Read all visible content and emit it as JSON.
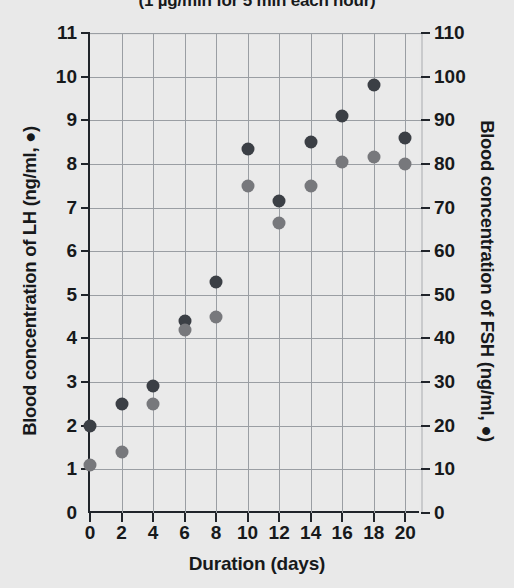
{
  "chart_data": {
    "type": "scatter",
    "title": "(1 µg/min for 5 min each hour)",
    "xlabel": "Duration (days)",
    "ylabel_left": "Blood concentration of LH (ng/ml, ●)",
    "ylabel_right": "Blood concentration of FSH (ng/ml, ●)",
    "x": [
      0,
      2,
      4,
      6,
      8,
      10,
      12,
      14,
      16,
      18,
      20
    ],
    "xlim": [
      0,
      21
    ],
    "xticks": [
      0,
      2,
      4,
      6,
      8,
      10,
      12,
      14,
      16,
      18,
      20
    ],
    "ylim_left": [
      0,
      11
    ],
    "yticks_left": [
      0,
      1,
      2,
      3,
      4,
      5,
      6,
      7,
      8,
      9,
      10,
      11
    ],
    "ylim_right": [
      0,
      110
    ],
    "yticks_right": [
      0,
      10,
      20,
      30,
      40,
      50,
      60,
      70,
      80,
      90,
      100,
      110
    ],
    "grid": true,
    "legend": "inline-in-axis-labels",
    "series": [
      {
        "name": "Blood concentration of LH (ng/ml)",
        "marker": "filled-circle",
        "color": "#3b3f45",
        "axis": "left",
        "values": [
          2.0,
          2.5,
          2.9,
          4.4,
          5.3,
          8.35,
          7.15,
          8.5,
          9.1,
          9.8,
          8.6
        ]
      },
      {
        "name": "Blood concentration of FSH (ng/ml)",
        "marker": "filled-circle",
        "color": "#77787c",
        "axis": "right",
        "values": [
          11,
          14,
          25,
          42,
          45,
          75,
          66.5,
          75,
          80.5,
          81.5,
          80
        ]
      }
    ]
  }
}
